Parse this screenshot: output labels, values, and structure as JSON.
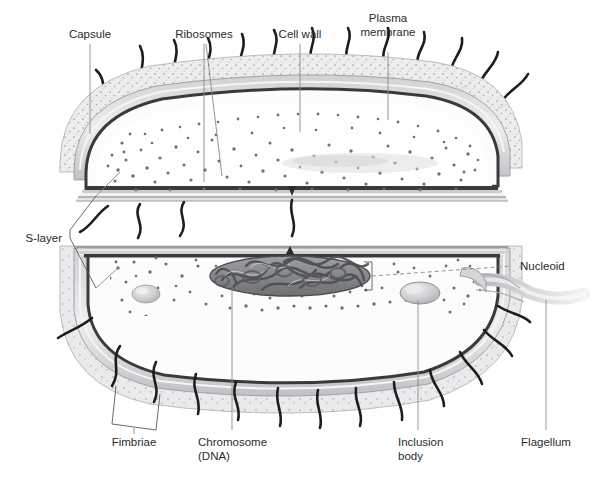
{
  "figure": {
    "background_color": "#ffffff",
    "ink_color": "#2b2b2b",
    "leader_color": "#8a8a8a"
  },
  "labels": {
    "capsule": "Capsule",
    "ribosomes": "Ribosomes",
    "cell_wall": "Cell wall",
    "plasma_membrane_line1": "Plasma",
    "plasma_membrane_line2": "membrane",
    "s_layer": "S-layer",
    "nucleoid": "Nucleoid",
    "fimbriae": "Fimbriae",
    "chromosome_line1": "Chromosome",
    "chromosome_line2": "(DNA)",
    "inclusion_line1": "Inclusion",
    "inclusion_line2": "body",
    "flagellum": "Flagellum"
  },
  "structures": {
    "capsule": {
      "name": "capsule",
      "fill": "#e8e9ea",
      "stipple": true
    },
    "cell_wall": {
      "name": "cell-wall",
      "fill": "#d2d4d6"
    },
    "plasma_membrane": {
      "name": "plasma-membrane",
      "stroke": "#3a3a3a"
    },
    "cytoplasm": {
      "name": "cytoplasm",
      "fill": "#fbfbfb"
    },
    "ribosome_dots": {
      "name": "ribosomes",
      "fill": "#6e7073",
      "count_upper": 120,
      "count_lower": 150
    },
    "nucleoid": {
      "name": "nucleoid-dna-mass",
      "fill": "#8e9093",
      "stroke": "#4a4c4f"
    },
    "inclusion_body": {
      "name": "inclusion-body",
      "fill": "#c9cbcd"
    },
    "flagellum": {
      "name": "flagellum",
      "fill": "#d8dadc"
    },
    "fimbriae": {
      "name": "fimbriae",
      "stroke": "#1d1d1d",
      "count": 26
    }
  }
}
